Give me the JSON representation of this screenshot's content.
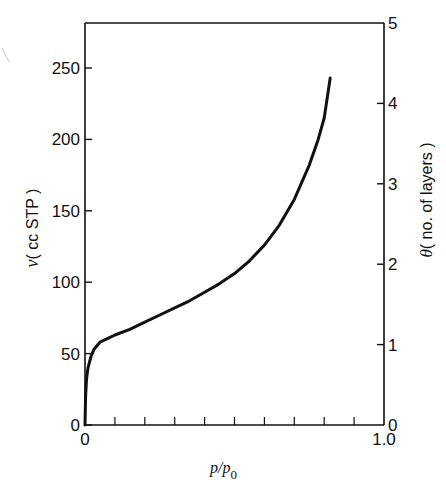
{
  "chart_data": {
    "type": "line",
    "title": "",
    "xlabel": "p/p0",
    "xlabel_main": "p/p",
    "xlabel_sub": "0",
    "ylabel": "v (cc STP)",
    "ylabel_italic": "v",
    "ylabel_rest": "( cc STP )",
    "y2label": "θ (no. of layers)",
    "y2label_italic": "θ",
    "y2label_rest": "( no. of layers )",
    "xlim": [
      0,
      1.0
    ],
    "ylim": [
      0,
      275
    ],
    "y2lim": [
      0,
      5
    ],
    "x_tick_labels": [
      "0",
      "1.0"
    ],
    "x_minor_ticks": [
      0.1,
      0.2,
      0.3,
      0.4,
      0.5,
      0.6,
      0.7,
      0.8,
      0.9
    ],
    "y_ticks": [
      0,
      50,
      100,
      150,
      200,
      250
    ],
    "y_tick_labels": [
      "0",
      "50",
      "100",
      "150",
      "200",
      "250"
    ],
    "y2_ticks": [
      0,
      1,
      2,
      3,
      4,
      5
    ],
    "y2_tick_labels": [
      "0",
      "1",
      "2",
      "3",
      "4",
      "5"
    ],
    "grid": false,
    "legend": null,
    "series": [
      {
        "name": "adsorption isotherm",
        "x": [
          0.0,
          0.002,
          0.005,
          0.01,
          0.02,
          0.03,
          0.05,
          0.08,
          0.1,
          0.15,
          0.2,
          0.25,
          0.3,
          0.35,
          0.4,
          0.45,
          0.5,
          0.55,
          0.6,
          0.65,
          0.7,
          0.75,
          0.78,
          0.8,
          0.82
        ],
        "y": [
          0,
          20,
          32,
          40,
          48,
          53,
          58,
          61,
          63,
          67,
          72,
          77,
          82,
          87,
          93,
          99,
          106,
          115,
          126,
          140,
          158,
          182,
          200,
          215,
          243
        ]
      }
    ]
  }
}
